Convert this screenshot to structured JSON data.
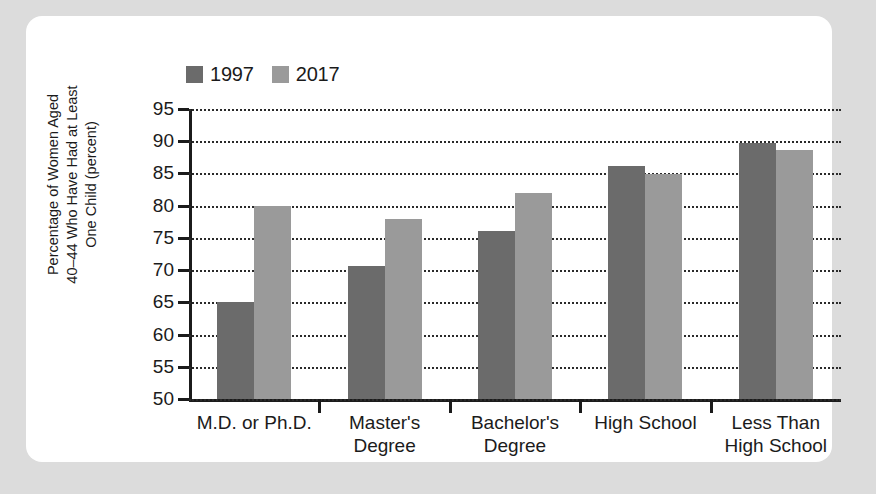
{
  "chart_data": {
    "type": "bar",
    "title": "",
    "xlabel": "",
    "ylabel": "Percentage of Women Aged 40–44 Who Have Had at Least One Child (percent)",
    "ylabel_lines": [
      "Percentage of Women Aged",
      "40–44 Who Have Had at Least",
      "One Child (percent)"
    ],
    "categories": [
      "M.D. or Ph.D.",
      "Master's Degree",
      "Bachelor's Degree",
      "High School",
      "Less Than High School"
    ],
    "category_lines": [
      [
        "M.D. or Ph.D."
      ],
      [
        "Master's",
        "Degree"
      ],
      [
        "Bachelor's",
        "Degree"
      ],
      [
        "High School"
      ],
      [
        "Less Than",
        "High School"
      ]
    ],
    "series": [
      {
        "name": "1997",
        "color": "#6b6b6b",
        "values": [
          65.0,
          70.7,
          76.0,
          86.2,
          89.7
        ]
      },
      {
        "name": "2017",
        "color": "#9a9a9a",
        "values": [
          80.0,
          78.0,
          82.0,
          84.9,
          88.7
        ]
      }
    ],
    "ylim": [
      50,
      95
    ],
    "ytick_labels": [
      "95",
      "90",
      "85",
      "80",
      "75",
      "70",
      "65",
      "60",
      "55",
      "50"
    ],
    "ytick_values": [
      95,
      90,
      85,
      80,
      75,
      70,
      65,
      60,
      55,
      50
    ],
    "grid": true,
    "grid_style": "dotted-horizontal",
    "legend_position": "top-left",
    "legend": [
      {
        "label": "1997",
        "color": "#6b6b6b"
      },
      {
        "label": "2017",
        "color": "#9a9a9a"
      }
    ]
  },
  "page": {
    "background_color": "#dcdcdc",
    "card_color": "#ffffff",
    "axis_color": "#1b1b1b"
  }
}
